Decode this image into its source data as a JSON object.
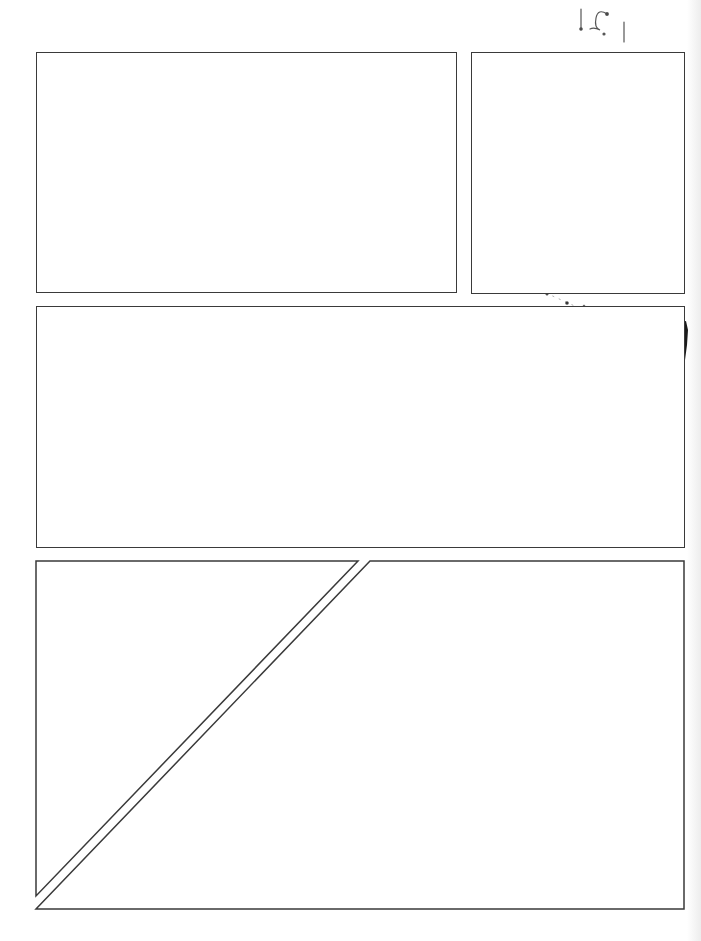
{
  "page": {
    "type": "comic-page-panel-template",
    "background": "#ffffff",
    "border_color": "#3a3a3a",
    "handwritten_mark": "1 ? 1",
    "panels": [
      {
        "id": 1,
        "label": "panel-1",
        "x": 36,
        "y": 52,
        "w": 421,
        "h": 241
      },
      {
        "id": 2,
        "label": "panel-2",
        "x": 471,
        "y": 52,
        "w": 214,
        "h": 242
      },
      {
        "id": 3,
        "label": "panel-3",
        "x": 36,
        "y": 306,
        "w": 649,
        "h": 242
      },
      {
        "id": 4,
        "label": "panel-4-left-triangle"
      },
      {
        "id": 5,
        "label": "panel-5-right-trapezoid"
      }
    ]
  }
}
